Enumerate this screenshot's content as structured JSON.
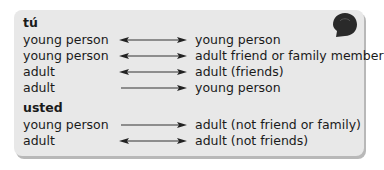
{
  "sections": [
    {
      "heading": "tú",
      "rows": [
        {
          "from": "young person",
          "arrow": "double",
          "to": "young person"
        },
        {
          "from": "young person",
          "arrow": "double",
          "to": "adult friend or family member"
        },
        {
          "from": "adult",
          "arrow": "double",
          "to": "adult (friends)"
        },
        {
          "from": "adult",
          "arrow": "right",
          "to": "young person"
        }
      ]
    },
    {
      "heading": "usted",
      "rows": [
        {
          "from": "young person",
          "arrow": "right",
          "to": "adult (not friend or family)"
        },
        {
          "from": "adult",
          "arrow": "double",
          "to": "adult (not friends)"
        }
      ]
    }
  ],
  "icon": "speech-bubble-icon",
  "colors": {
    "box_bg": "#e8e8e8",
    "shadow": "#b8b8b8",
    "text": "#1a1a1a",
    "icon": "#2a2a2a"
  }
}
